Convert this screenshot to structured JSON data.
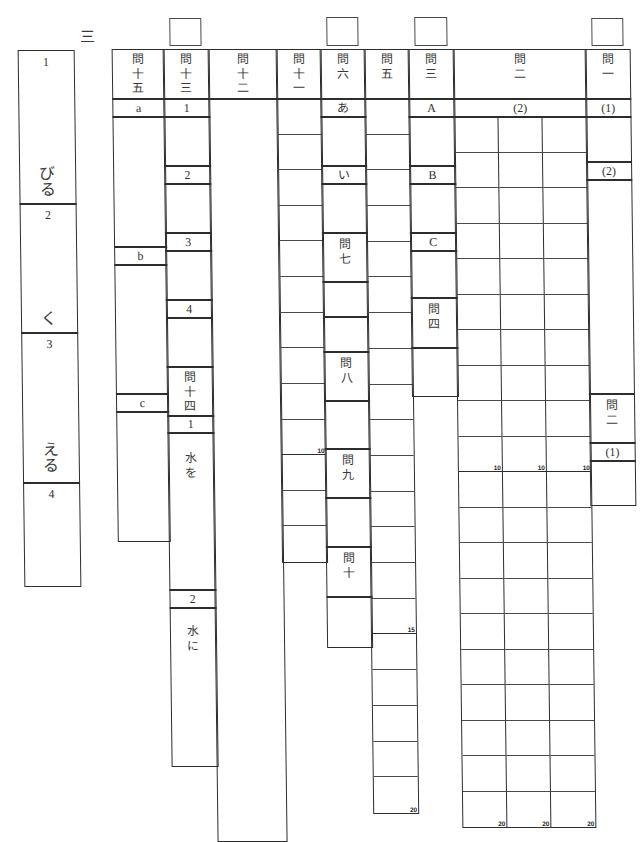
{
  "section": {
    "label": "三"
  },
  "score_boxes": [
    "",
    "",
    "",
    ""
  ],
  "kanji_reading": {
    "items": [
      {
        "number": "1",
        "okurigana": "びる"
      },
      {
        "number": "2",
        "okurigana": "く"
      },
      {
        "number": "3",
        "okurigana": "える"
      },
      {
        "number": "4",
        "okurigana": ""
      }
    ]
  },
  "q15": {
    "header": "問十五",
    "parts": [
      "a",
      "b",
      "c"
    ]
  },
  "q13": {
    "header": "問十三",
    "parts": [
      "1",
      "2",
      "3",
      "4"
    ]
  },
  "q14": {
    "header": "問十四",
    "parts": [
      {
        "number": "1",
        "prompt": "水を"
      },
      {
        "number": "2",
        "prompt": "水に"
      }
    ]
  },
  "q12": {
    "header": "問十二"
  },
  "q11": {
    "header": "問十一",
    "grid": {
      "rows": 13,
      "cols": 1,
      "marks": {
        "10": "10"
      }
    }
  },
  "q6": {
    "header": "問六",
    "parts": [
      "あ",
      "い"
    ]
  },
  "q7": {
    "header": "問七"
  },
  "q8": {
    "header": "問八"
  },
  "q9": {
    "header": "問九"
  },
  "q10": {
    "header": "問十"
  },
  "q5": {
    "header": "問五",
    "grid": {
      "rows": 20,
      "cols": 1,
      "marks": {
        "15": "15",
        "20": "20"
      }
    }
  },
  "q3": {
    "header": "問三",
    "parts": [
      "A",
      "B",
      "C"
    ]
  },
  "q4": {
    "header": "問四"
  },
  "q2": {
    "header": "問二",
    "sub_label": "(2)",
    "grid": {
      "rows": 20,
      "cols": 3,
      "marks": {
        "10": "10",
        "20": "20"
      }
    }
  },
  "next_section": {
    "q1_header": "問一",
    "q1_parts": [
      "(1)",
      "(2)"
    ],
    "q2_header": "問二",
    "q2_parts": [
      "(1)"
    ]
  }
}
